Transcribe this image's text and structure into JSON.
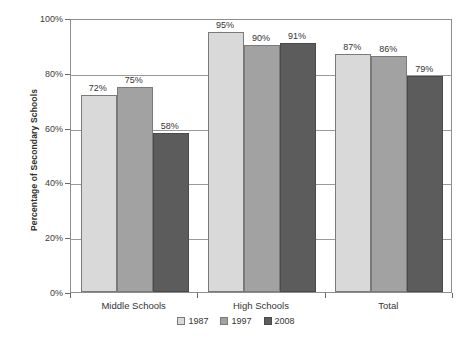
{
  "chart_data": {
    "type": "bar",
    "title": "",
    "xlabel": "",
    "ylabel": "Percentage of Secondary Schools",
    "categories": [
      "Middle Schools",
      "High Schools",
      "Total"
    ],
    "series": [
      {
        "name": "1987",
        "values": [
          72,
          75,
          58
        ],
        "color": "#d9d9d9"
      },
      {
        "name": "1997",
        "values": [
          95,
          90,
          91
        ],
        "color": "#a2a2a2"
      },
      {
        "name": "2008",
        "values": [
          87,
          86,
          79
        ],
        "color": "#5c5c5c"
      }
    ],
    "groups": [
      {
        "category": "Middle Schools",
        "bars": [
          {
            "series": "1987",
            "value": 72,
            "label": "72%"
          },
          {
            "series": "1997",
            "value": 75,
            "label": "75%"
          },
          {
            "series": "2008",
            "value": 58,
            "label": "58%"
          }
        ]
      },
      {
        "category": "High Schools",
        "bars": [
          {
            "series": "1987",
            "value": 95,
            "label": "95%"
          },
          {
            "series": "1997",
            "value": 90,
            "label": "90%"
          },
          {
            "series": "2008",
            "value": 91,
            "label": "91%"
          }
        ]
      },
      {
        "category": "Total",
        "bars": [
          {
            "series": "1987",
            "value": 87,
            "label": "87%"
          },
          {
            "series": "1997",
            "value": 86,
            "label": "86%"
          },
          {
            "series": "2008",
            "value": 79,
            "label": "79%"
          }
        ]
      }
    ],
    "ylim": [
      0,
      100
    ],
    "ytick_values": [
      0,
      20,
      40,
      60,
      80,
      100
    ],
    "ytick_labels": [
      "0%",
      "20%",
      "40%",
      "60%",
      "80%",
      "100%"
    ],
    "grid": true,
    "legend_position": "bottom",
    "legend_entries": [
      "1987",
      "1997",
      "2008"
    ],
    "colors": {
      "series_1987": "#d9d9d9",
      "series_1997": "#a2a2a2",
      "series_2008": "#5c5c5c",
      "axis": "#8d8d8d",
      "grid": "#9a9a9a",
      "text": "#333333",
      "background": "#ffffff"
    }
  }
}
